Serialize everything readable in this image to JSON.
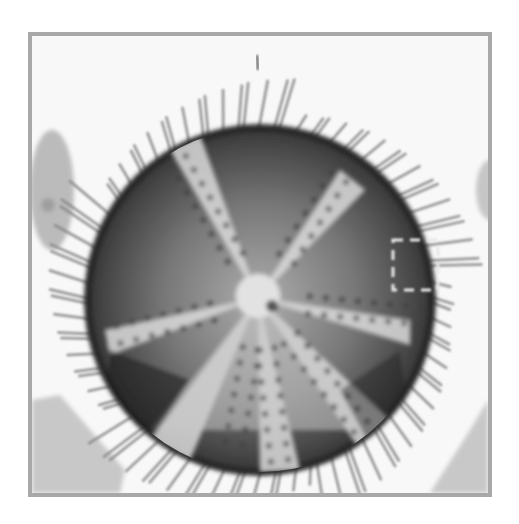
{
  "image": {
    "subject": "sea urchin test (echinoid skeleton) illustration, aboral view",
    "style": "grayscale engraving/photograph",
    "colors": {
      "background": "#ffffff",
      "frame": "#a8a8a8",
      "body_dark": "#1e1e1e",
      "body_mid": "#6a6a6a",
      "ambulacra_light": "#d8d8d8",
      "spines": "#8a8a8a"
    },
    "annotation": "dashed rectangle on right edge of body"
  }
}
